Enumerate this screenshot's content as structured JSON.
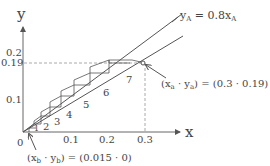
{
  "diagram": {
    "type": "McCabe-Thiele style staircase (operating line and equilibrium line)",
    "axes": {
      "x_label": "x",
      "y_label": "y",
      "origin_label": "0",
      "x_ticks": [
        "0.1",
        "0.2",
        "0.3"
      ],
      "y_ticks": [
        "0.1",
        "0.19",
        "0.2"
      ]
    },
    "lines": {
      "upper_label": "y",
      "upper_label_sub": "A",
      "upper_label_eq": " = 0.8x",
      "upper_label_sub2": "A"
    },
    "stages": [
      "1",
      "2",
      "3",
      "4",
      "5",
      "6",
      "7"
    ],
    "points": {
      "a": {
        "label_prefix": "(x",
        "sub_x": "a",
        "mid": " · y",
        "sub_y": "a",
        "suffix": ") = (0.3 · 0.19)"
      },
      "b": {
        "label_prefix": "(x",
        "sub_x": "b",
        "mid": " · y",
        "sub_y": "b",
        "suffix": ") = (0.015 · 0)"
      }
    },
    "colors": {
      "line": "#555555",
      "dashed": "#aaaaaa",
      "text": "#444444"
    }
  }
}
